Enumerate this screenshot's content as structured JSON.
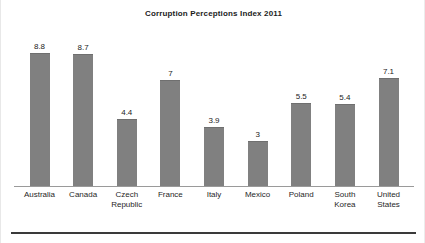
{
  "chart_data": {
    "type": "bar",
    "title": "Corruption Perceptions Index 2011",
    "xlabel": "",
    "ylabel": "",
    "ylim": [
      0,
      9.7
    ],
    "grid": false,
    "legend": false,
    "bar_color": "#808080",
    "axis_color": "#9a9a9a",
    "text_color": "#1f1f1f",
    "categories": [
      "Australia",
      "Canada",
      "Czech Republic",
      "France",
      "Italy",
      "Mexico",
      "Poland",
      "South Korea",
      "United States"
    ],
    "category_lines": [
      [
        "Australia"
      ],
      [
        "Canada"
      ],
      [
        "Czech",
        "Republic"
      ],
      [
        "France"
      ],
      [
        "Italy"
      ],
      [
        "Mexico"
      ],
      [
        "Poland"
      ],
      [
        "South",
        "Korea"
      ],
      [
        "United",
        "States"
      ]
    ],
    "values": [
      8.8,
      8.7,
      4.4,
      7,
      3.9,
      3,
      5.5,
      5.4,
      7.1
    ],
    "value_labels": [
      "8.8",
      "8.7",
      "4.4",
      "7",
      "3.9",
      "3",
      "5.5",
      "5.4",
      "7.1"
    ]
  }
}
